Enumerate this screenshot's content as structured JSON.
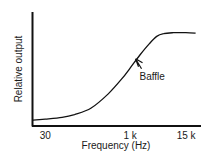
{
  "chart_data": {
    "type": "line",
    "title": "",
    "xlabel": "Frequency (Hz)",
    "ylabel": "Relative output",
    "x_scale": "log",
    "x_ticks": [
      {
        "value": 30,
        "label": "30"
      },
      {
        "value": 1000,
        "label": "1 k"
      },
      {
        "value": 15000,
        "label": "15 k"
      }
    ],
    "xlim": [
      18,
      18000
    ],
    "ylim": [
      0,
      1
    ],
    "grid": false,
    "legend": "none",
    "series": [
      {
        "name": "Baffle response",
        "x": [
          18,
          30,
          60,
          100,
          200,
          400,
          700,
          1000,
          1500,
          2200,
          3000,
          4000,
          6000,
          10000,
          15000
        ],
        "y": [
          0.02,
          0.03,
          0.05,
          0.08,
          0.15,
          0.3,
          0.46,
          0.58,
          0.72,
          0.84,
          0.92,
          0.95,
          0.96,
          0.96,
          0.955
        ]
      }
    ],
    "annotations": [
      {
        "text": "Baffle",
        "x": 1200,
        "y": 0.68,
        "type": "arrow"
      }
    ]
  }
}
